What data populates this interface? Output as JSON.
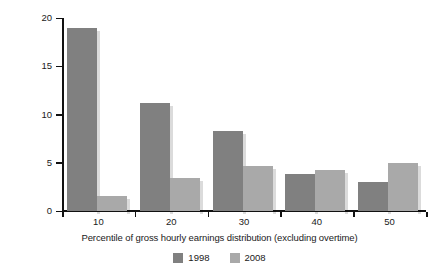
{
  "chart_data": {
    "type": "bar",
    "title": "",
    "subtitle": "",
    "xlabel": "Percentile of gross hourly earnings distribution (excluding overtime)",
    "ylabel": "Pay gap: ethnic minority groups (%)",
    "categories": [
      "10",
      "20",
      "30",
      "40",
      "50"
    ],
    "series": [
      {
        "name": "1998",
        "color": "#808080",
        "values": [
          19.0,
          11.2,
          8.3,
          3.8,
          3.0
        ]
      },
      {
        "name": "2008",
        "color": "#a9a9a9",
        "values": [
          1.6,
          3.4,
          4.7,
          4.2,
          5.0
        ]
      }
    ],
    "ylim": [
      0,
      20
    ],
    "yticks": [
      0,
      5,
      10,
      15,
      20
    ],
    "ytick_labels": [
      "0",
      "5",
      "10",
      "15",
      "20"
    ],
    "grid": false,
    "legend_position": "bottom-center"
  },
  "legend": {
    "items": [
      {
        "label": "1998",
        "color": "#808080"
      },
      {
        "label": "2008",
        "color": "#a9a9a9"
      }
    ]
  },
  "colors": {
    "series_1998": "#808080",
    "series_2008": "#a9a9a9",
    "axis": "#111111",
    "text": "#1a1a1a",
    "background": "#ffffff"
  }
}
